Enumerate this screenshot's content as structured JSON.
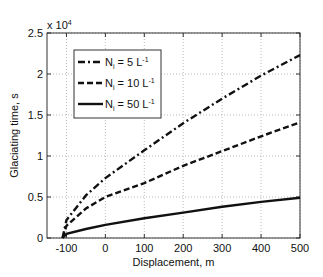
{
  "chart_data": {
    "type": "line",
    "title": "",
    "xlabel": "Displacement, m",
    "ylabel": "Glaciating time, s",
    "y_multiplier": "x 10^4",
    "xlim": [
      -150,
      500
    ],
    "ylim": [
      0,
      2.5
    ],
    "xticks": [
      -100,
      0,
      100,
      200,
      300,
      400,
      500
    ],
    "yticks": [
      0,
      0.5,
      1,
      1.5,
      2,
      2.5
    ],
    "grid": true,
    "legend_position": "upper left",
    "x": [
      -110,
      -100,
      -50,
      0,
      100,
      200,
      300,
      400,
      500
    ],
    "series": [
      {
        "name": "N_i = 5 L^-1",
        "style": "dash-dot",
        "values": [
          0,
          0.22,
          0.52,
          0.73,
          1.07,
          1.4,
          1.7,
          1.98,
          2.23
        ]
      },
      {
        "name": "N_i = 10 L^-1",
        "style": "dashed",
        "values": [
          0,
          0.15,
          0.36,
          0.5,
          0.67,
          0.88,
          1.06,
          1.24,
          1.41
        ]
      },
      {
        "name": "N_i = 50 L^-1",
        "style": "solid",
        "values": [
          0,
          0.05,
          0.11,
          0.16,
          0.24,
          0.31,
          0.38,
          0.44,
          0.49
        ]
      }
    ]
  },
  "labels": {
    "multiplier": "x 10",
    "multiplier_exp": "4",
    "xlabel": "Displacement, m",
    "ylabel": "Glaciating time, s",
    "legend": [
      {
        "prefix": "N",
        "sub": "i",
        "mid": " = 5 L",
        "sup": "-1"
      },
      {
        "prefix": "N",
        "sub": "i",
        "mid": " = 10 L",
        "sup": "-1"
      },
      {
        "prefix": "N",
        "sub": "i",
        "mid": " = 50 L",
        "sup": "-1"
      }
    ],
    "xticks": [
      "-100",
      "0",
      "100",
      "200",
      "300",
      "400",
      "500"
    ],
    "yticks": [
      "0",
      "0.5",
      "1",
      "1.5",
      "2",
      "2.5"
    ]
  }
}
